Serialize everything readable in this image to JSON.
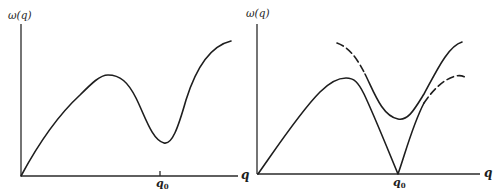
{
  "panels": [
    {
      "id": "left",
      "y_axis_label": "ω(q)",
      "x_axis_label": "q",
      "marker_label": "q",
      "marker_subscript": "0",
      "description": "Single dispersion branch with maximum then minimum (dip) near q0, rising again"
    },
    {
      "id": "right",
      "y_axis_label": "ω(q)",
      "x_axis_label": "q",
      "marker_label": "q",
      "marker_subscript": "0",
      "description": "Two branches: lower branch goes to zero at q0 (cusp), upper branch has minimum above q0; dashed segments indicate extrapolated parts"
    }
  ],
  "colors": {
    "line": "#1e1e1e",
    "background": "#ffffff"
  }
}
